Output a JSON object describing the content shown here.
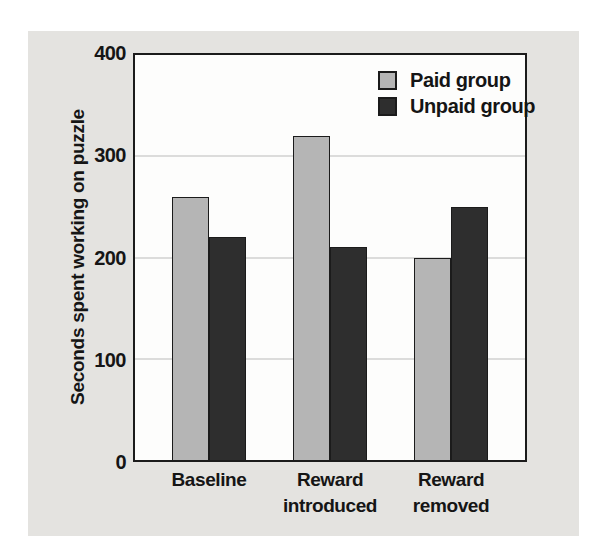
{
  "figure": {
    "panel_background": "#e4e3e0",
    "plot_background": "#fdfdfc",
    "frame_color": "#1b1b1b",
    "gridline_color": "#bcbcba",
    "text_color": "#151515"
  },
  "chart_data": {
    "type": "bar",
    "title": "",
    "xlabel": "",
    "ylabel": "Seconds spent working on puzzle",
    "categories": [
      "Baseline",
      "Reward\nintroduced",
      "Reward\nremoved"
    ],
    "series": [
      {
        "name": "Paid group",
        "color": "#b5b5b5",
        "values": [
          260,
          320,
          200
        ]
      },
      {
        "name": "Unpaid group",
        "color": "#2e2e2e",
        "values": [
          220,
          210,
          250
        ]
      }
    ],
    "ylim": [
      0,
      400
    ],
    "yticks": [
      0,
      100,
      200,
      300,
      400
    ],
    "gridlines": [
      100,
      200,
      300
    ],
    "grid": true,
    "legend_position": "top-right"
  }
}
